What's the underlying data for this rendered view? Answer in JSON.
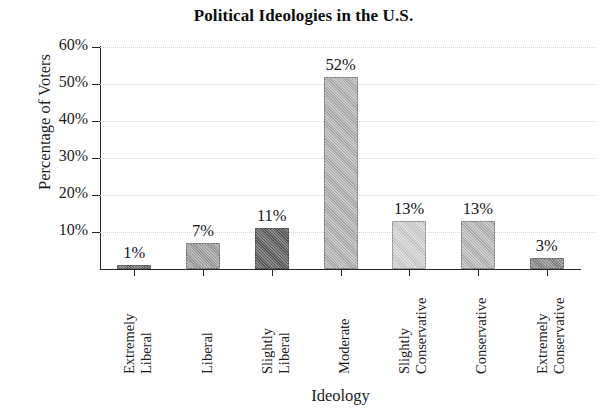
{
  "chart_data": {
    "type": "bar",
    "title": "Political Ideologies in the U.S.",
    "xlabel": "Ideology",
    "ylabel": "Percentage of Voters",
    "categories": [
      "Extremely Liberal",
      "Liberal",
      "Slightly Liberal",
      "Moderate",
      "Slightly Conservative",
      "Conservative",
      "Extremely Conservative"
    ],
    "category_lines": [
      [
        "Extremely",
        "Liberal"
      ],
      [
        "Liberal"
      ],
      [
        "Slightly",
        "Liberal"
      ],
      [
        "Moderate"
      ],
      [
        "Slightly",
        "Conservative"
      ],
      [
        "Conservative"
      ],
      [
        "Extremely",
        "Conservative"
      ]
    ],
    "values": [
      1,
      7,
      11,
      52,
      13,
      13,
      3
    ],
    "value_labels": [
      "1%",
      "7%",
      "11%",
      "52%",
      "13%",
      "13%",
      "3%"
    ],
    "bar_colors": [
      "#6e6e6e",
      "#9f9f9f",
      "#5b5b5b",
      "#b4b4b4",
      "#d3d3d3",
      "#b9b9b9",
      "#888888"
    ],
    "ylim": [
      0,
      60
    ],
    "ytick_values": [
      10,
      20,
      30,
      40,
      50,
      60
    ],
    "ytick_labels": [
      "10%",
      "20%",
      "30%",
      "40%",
      "50%",
      "60%"
    ],
    "grid": true,
    "grid_color": "#d2d2d2",
    "legend": "none",
    "axis_color": "#262626",
    "background": "#ffffff"
  }
}
